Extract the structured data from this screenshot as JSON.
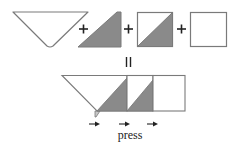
{
  "diagram": {
    "colors": {
      "fill_dark": "#8a8a8a",
      "fill_light": "#ffffff",
      "outline": "#7a7a7a",
      "symbol": "#222222",
      "tail": "#c8c8c8"
    },
    "top_row": {
      "pieces": [
        {
          "name": "large-triangle",
          "description": "inverted setting triangle"
        },
        {
          "name": "dark-triangle",
          "description": "dark right triangle"
        },
        {
          "name": "half-square-triangle",
          "description": "light/dark half-square triangle"
        },
        {
          "name": "light-square",
          "description": "light square"
        }
      ],
      "operators": [
        "+",
        "+",
        "+"
      ]
    },
    "equals_symbol": "=",
    "bottom_row": {
      "description": "assembled row",
      "arrows_count": 3,
      "label": "press"
    }
  }
}
